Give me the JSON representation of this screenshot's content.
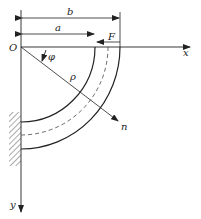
{
  "diagram": {
    "labels": {
      "origin": "O",
      "x_axis": "x",
      "y_axis": "y",
      "dim_b": "b",
      "dim_a": "a",
      "force": "F",
      "angle": "φ",
      "radius": "ρ",
      "normal": "n"
    },
    "colors": {
      "line": "#222222",
      "hatch": "#555555"
    }
  }
}
